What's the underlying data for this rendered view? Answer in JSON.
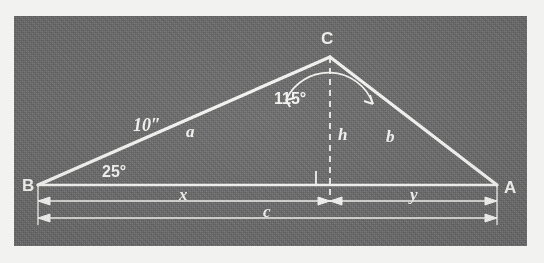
{
  "figure": {
    "kind": "geometry-diagram",
    "background_color": "#6b6b6b",
    "ink_color": "#f4f4f2",
    "page_color": "#f2f2f0",
    "vertices": {
      "B": {
        "label": "B",
        "x": 38,
        "y": 185
      },
      "A": {
        "label": "A",
        "x": 497,
        "y": 185
      },
      "C": {
        "label": "C",
        "x": 330,
        "y": 57
      },
      "foot": {
        "label": "",
        "x": 330,
        "y": 185
      }
    },
    "sides": [
      {
        "name": "side-a",
        "label": "a",
        "from": "B",
        "to": "C",
        "label_x": 191,
        "label_y": 129
      },
      {
        "name": "side-b",
        "label": "b",
        "from": "C",
        "to": "A",
        "label_x": 391,
        "label_y": 135
      },
      {
        "name": "side-c",
        "label": "c",
        "from": "B",
        "to": "A",
        "label_x": 268,
        "label_y": 221
      }
    ],
    "measures": [
      {
        "name": "side-a-length",
        "label": "10″",
        "x": 150,
        "y": 124
      },
      {
        "name": "angle-B",
        "label": "25°",
        "x": 119,
        "y": 171
      },
      {
        "name": "angle-C",
        "label": "115°",
        "x": 300,
        "y": 96
      }
    ],
    "altitude": {
      "name": "altitude-h",
      "label": "h",
      "label_x": 341,
      "label_y": 138,
      "style": "dashed"
    },
    "right_angle": {
      "name": "right-angle-marker",
      "x": 312,
      "y": 167,
      "size": 14
    },
    "dimensions": [
      {
        "name": "dimension-x",
        "label": "x",
        "from_x": 38,
        "to_x": 330,
        "y": 201,
        "label_x": 184,
        "label_y": 199
      },
      {
        "name": "dimension-y",
        "label": "y",
        "from_x": 330,
        "to_x": 497,
        "y": 201,
        "label_x": 414,
        "label_y": 199
      },
      {
        "name": "dimension-c",
        "label": "c",
        "from_x": 38,
        "to_x": 497,
        "y": 218,
        "label_x": 268,
        "label_y": 216
      }
    ]
  }
}
